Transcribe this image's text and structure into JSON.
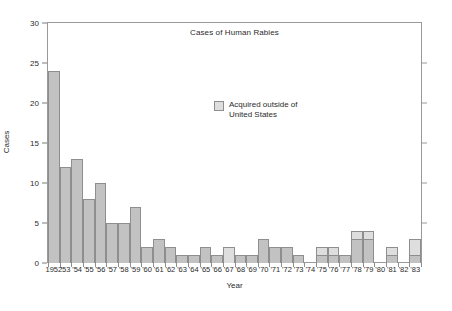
{
  "chart_data": {
    "type": "bar",
    "title": "Cases of Human Rabies",
    "xlabel": "Year",
    "ylabel": "Cases",
    "ylim": [
      0,
      30
    ],
    "yticks": [
      0,
      5,
      10,
      15,
      20,
      25,
      30
    ],
    "grid": false,
    "legend_position": "inside-upper-center",
    "stacked": true,
    "categories": [
      "1952",
      "'53",
      "'54",
      "'55",
      "'56",
      "'57",
      "'58",
      "'59",
      "'60",
      "'61",
      "'62",
      "'63",
      "'64",
      "'65",
      "'66",
      "'67",
      "'68",
      "'69",
      "'70",
      "'71",
      "'72",
      "'73",
      "'74",
      "'75",
      "'76",
      "'77",
      "'78",
      "'79",
      "'80",
      "'81",
      "'82",
      "'83"
    ],
    "series": [
      {
        "name": "Acquired in United States",
        "color": "#c2c2c2",
        "values": [
          24,
          12,
          13,
          8,
          10,
          5,
          5,
          7,
          2,
          3,
          2,
          1,
          1,
          2,
          1,
          0,
          1,
          1,
          3,
          2,
          2,
          1,
          0,
          1,
          1,
          1,
          3,
          3,
          0,
          1,
          0,
          1
        ]
      },
      {
        "name": "Acquired outside of United States",
        "color": "#dedede",
        "values": [
          0,
          0,
          0,
          0,
          0,
          0,
          0,
          0,
          0,
          0,
          0,
          0,
          0,
          0,
          0,
          2,
          0,
          0,
          0,
          0,
          0,
          0,
          0,
          1,
          1,
          0,
          1,
          1,
          0,
          1,
          0,
          2
        ]
      }
    ],
    "totals": [
      24,
      12,
      13,
      8,
      10,
      5,
      5,
      7,
      2,
      3,
      2,
      1,
      1,
      2,
      1,
      2,
      1,
      1,
      3,
      2,
      2,
      1,
      0,
      2,
      2,
      1,
      4,
      4,
      0,
      2,
      0,
      3
    ]
  },
  "legend": {
    "label": "Acquired outside of\nUnited States",
    "swatch_color": "#dedede"
  },
  "colors": {
    "bar_domestic": "#c2c2c2",
    "bar_foreign": "#dedede",
    "bar_outline": "#8e8e8e",
    "axis": "#9a9a9a",
    "text": "#2b2b2b",
    "background": "#ffffff"
  }
}
